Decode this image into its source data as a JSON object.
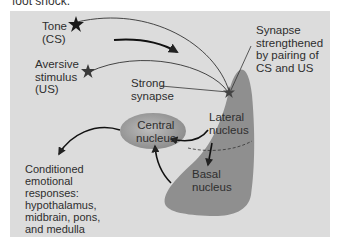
{
  "caption": "foot shock.",
  "labels": {
    "tone": [
      "Tone",
      "(CS)"
    ],
    "aversive": [
      "Aversive",
      "stimulus",
      "(US)"
    ],
    "strong_synapse": [
      "Strong",
      "synapse"
    ],
    "synapse_strengthened": [
      "Synapse",
      "strengthened",
      "by pairing of",
      "CS and US"
    ],
    "central_nucleus": [
      "Central",
      "nucleus"
    ],
    "lateral_nucleus": [
      "Lateral",
      "nucleus"
    ],
    "basal_nucleus": [
      "Basal",
      "nucleus"
    ],
    "conditioned": [
      "Conditioned",
      "emotional",
      "responses:",
      "hypothalamus,",
      "midbrain, pons,",
      "and medulla"
    ]
  },
  "colors": {
    "panel_bg": "#dcdcdc",
    "amygdala_fill": "#8f8f8f",
    "central_fill": "#a9a9a9",
    "line": "#333333"
  }
}
